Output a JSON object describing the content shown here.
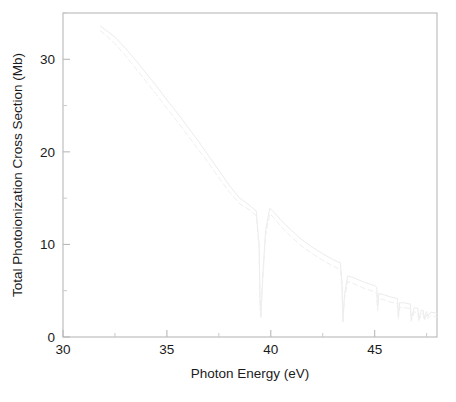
{
  "chart_data": {
    "type": "line",
    "title": "",
    "subtitle": "",
    "xlabel": "Photon Energy (eV)",
    "ylabel": "Total Photoionization Cross Section (Mb)",
    "xlim": [
      30,
      48
    ],
    "ylim": [
      0,
      35
    ],
    "xticks": [
      30,
      35,
      40,
      45
    ],
    "xticklabels": [
      "30",
      "35",
      "40",
      "45"
    ],
    "xminorticks": [
      32.5,
      37.5,
      42.5,
      47.5
    ],
    "yticks": [
      0,
      10,
      20,
      30
    ],
    "yticklabels": [
      "0",
      "10",
      "20",
      "30"
    ],
    "yminorticks": [
      5,
      15,
      25,
      35
    ],
    "grid": false,
    "legend": null,
    "legend_position": "none",
    "annotations": [],
    "resonance_energies": [
      39.5,
      43.45,
      45.15,
      46.15,
      46.75,
      47.1,
      47.35,
      47.52,
      47.64,
      47.73,
      47.8,
      47.86
    ],
    "series": [
      {
        "name": "solid",
        "style": "solid",
        "color": "#ececec",
        "x": [
          31.8,
          32.5,
          33.0,
          33.5,
          34.0,
          34.5,
          35.0,
          35.5,
          36.0,
          36.5,
          37.0,
          37.5,
          38.0,
          38.5,
          39.0,
          39.3,
          39.44,
          39.48,
          39.52,
          39.6,
          39.75,
          39.95,
          40.1,
          40.5,
          41.0,
          41.5,
          42.0,
          42.5,
          43.0,
          43.35,
          43.43,
          43.47,
          43.55,
          43.7,
          44.0,
          44.5,
          45.0,
          45.1,
          45.14,
          45.2,
          45.4,
          45.8,
          46.1,
          46.14,
          46.2,
          46.4,
          46.72,
          46.76,
          46.9,
          47.08,
          47.12,
          47.25,
          47.34,
          47.38,
          47.5,
          47.55,
          47.7,
          47.8,
          47.9,
          48.0
        ],
        "y": [
          33.6,
          32.4,
          31.2,
          29.9,
          28.5,
          27.1,
          25.6,
          24.2,
          22.7,
          21.2,
          19.6,
          18.0,
          16.4,
          15.0,
          14.2,
          13.6,
          10.0,
          4.0,
          2.2,
          6.0,
          11.5,
          13.9,
          13.6,
          12.6,
          11.5,
          10.5,
          9.7,
          9.0,
          8.35,
          8.0,
          5.8,
          1.8,
          4.6,
          6.6,
          6.4,
          5.9,
          5.55,
          5.35,
          3.2,
          4.7,
          4.6,
          4.3,
          4.15,
          2.2,
          3.7,
          3.7,
          3.55,
          1.9,
          3.15,
          3.1,
          1.9,
          2.9,
          2.85,
          2.0,
          2.75,
          2.2,
          2.7,
          2.65,
          2.6,
          2.55
        ]
      },
      {
        "name": "dashed",
        "style": "dashed",
        "color": "#efefef",
        "x": [
          31.8,
          32.5,
          33.0,
          33.5,
          34.0,
          34.5,
          35.0,
          35.5,
          36.0,
          36.5,
          37.0,
          37.5,
          38.0,
          38.5,
          39.0,
          39.3,
          39.44,
          39.48,
          39.52,
          39.6,
          39.75,
          39.95,
          40.1,
          40.5,
          41.0,
          41.5,
          42.0,
          42.5,
          43.0,
          43.35,
          43.43,
          43.47,
          43.55,
          43.7,
          44.0,
          44.5,
          45.0,
          45.1,
          45.14,
          45.2,
          45.4,
          45.8,
          46.1,
          46.14,
          46.2,
          46.4,
          46.72,
          46.76,
          46.9,
          47.08,
          47.12,
          47.25,
          47.34,
          47.38,
          47.5,
          47.55,
          47.7,
          47.8,
          47.9,
          48.0
        ],
        "y": [
          33.1,
          31.7,
          30.4,
          29.0,
          27.6,
          26.2,
          24.7,
          23.3,
          21.8,
          20.3,
          18.8,
          17.2,
          15.7,
          14.4,
          13.7,
          13.1,
          9.6,
          3.7,
          2.1,
          5.7,
          11.0,
          13.3,
          13.0,
          11.9,
          10.8,
          9.8,
          9.0,
          8.3,
          7.65,
          7.3,
          5.2,
          1.6,
          4.1,
          6.0,
          5.75,
          5.25,
          4.9,
          4.7,
          2.85,
          4.15,
          4.05,
          3.75,
          3.6,
          1.95,
          3.2,
          3.2,
          3.05,
          1.7,
          2.7,
          2.65,
          1.7,
          2.5,
          2.45,
          1.8,
          2.35,
          1.95,
          2.3,
          2.25,
          2.2,
          2.15
        ]
      }
    ]
  },
  "axes": {
    "xlabel": "Photon Energy (eV)",
    "ylabel": "Total Photoionization Cross Section (Mb)"
  }
}
